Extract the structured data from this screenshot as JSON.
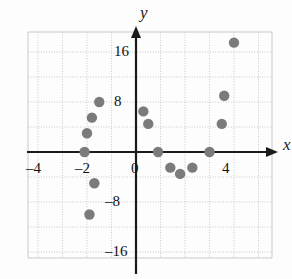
{
  "chart_data": {
    "type": "scatter",
    "title": "",
    "xlabel": "x",
    "ylabel": "y",
    "xlim": [
      -5.2,
      5.0
    ],
    "ylim": [
      -21,
      22
    ],
    "grid": true,
    "legend": false,
    "x_ticks": [
      -4,
      -2,
      0,
      4
    ],
    "x_tick_labels": [
      "–4",
      "–2",
      "0",
      "4"
    ],
    "y_ticks": [
      16,
      8,
      -8,
      -16
    ],
    "y_tick_labels": [
      "16",
      "8",
      "–8",
      "–16"
    ],
    "x_grid_step": 1,
    "y_grid_step": 4,
    "point_color": "#7b7b7b",
    "axis_color": "#1a1a1a",
    "grid_color": "#c9c9c9",
    "points": [
      {
        "x": -2.1,
        "y": 0.0
      },
      {
        "x": -2.0,
        "y": 3.0
      },
      {
        "x": -1.8,
        "y": 5.5
      },
      {
        "x": -1.5,
        "y": 8.0
      },
      {
        "x": -1.7,
        "y": -5.0
      },
      {
        "x": -1.9,
        "y": -10.0
      },
      {
        "x": 0.3,
        "y": 6.5
      },
      {
        "x": 0.5,
        "y": 4.5
      },
      {
        "x": 0.9,
        "y": 0.0
      },
      {
        "x": 1.4,
        "y": -2.5
      },
      {
        "x": 1.8,
        "y": -3.5
      },
      {
        "x": 2.3,
        "y": -2.5
      },
      {
        "x": 3.0,
        "y": 0.0
      },
      {
        "x": 3.5,
        "y": 4.5
      },
      {
        "x": 3.6,
        "y": 9.0
      },
      {
        "x": 4.0,
        "y": 17.5
      }
    ]
  },
  "axis_labels": {
    "x": "x",
    "y": "y"
  },
  "geometry": {
    "origin_px_x": 136,
    "origin_px_y": 152,
    "px_per_x_unit": 24.5,
    "px_per_y_unit": 6.25,
    "frame_left": 28,
    "frame_top": 32,
    "frame_right": 272,
    "frame_bottom": 258,
    "point_radius": 5.2
  }
}
